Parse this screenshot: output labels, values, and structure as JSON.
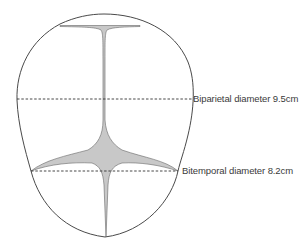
{
  "diagram": {
    "labels": {
      "biparietal": "Biparietal diameter 9.5cm",
      "bitemporal": "Bitemporal diameter 8.2cm"
    },
    "measurements": [
      {
        "name": "Biparietal diameter",
        "value": 9.5,
        "unit": "cm"
      },
      {
        "name": "Bitemporal diameter",
        "value": 8.2,
        "unit": "cm"
      }
    ],
    "colors": {
      "outline": "#4a4a4a",
      "suture_fill": "#c8c8c8",
      "dashed_line": "#333333",
      "text": "#3a3a3a"
    }
  }
}
